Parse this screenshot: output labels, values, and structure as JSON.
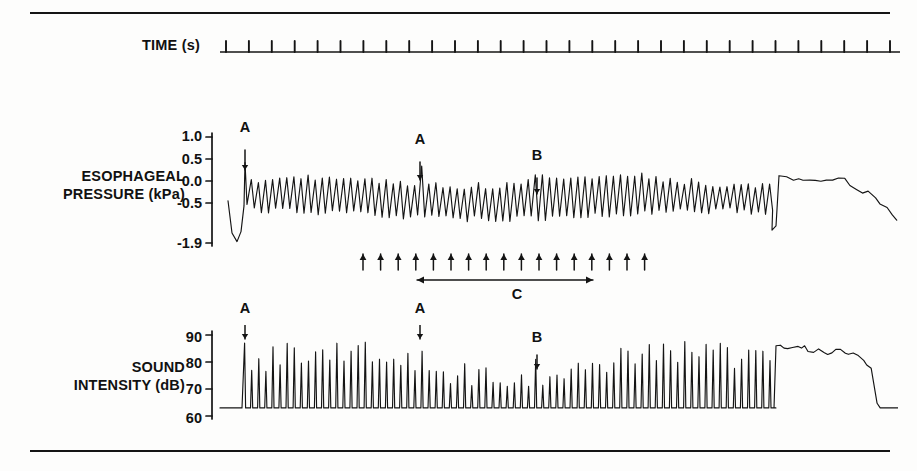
{
  "figure": {
    "title_rules": {
      "top_rule": "horizontal-rule",
      "bottom_rule": "horizontal-rule"
    }
  },
  "rows": {
    "time": {
      "label": "TIME (s)"
    },
    "pressure": {
      "label": "ESOPHAGEAL\nPRESSURE (kPa)"
    },
    "sound": {
      "label": "SOUND\nINTENSITY (dB)"
    }
  },
  "axes": {
    "pressure_ticks": [
      "1.0",
      "0.5",
      "0.0",
      "-0.5",
      "-1.9"
    ],
    "sound_ticks": [
      "90",
      "80",
      "70",
      "60"
    ]
  },
  "markers": {
    "pressure": [
      {
        "label": "A",
        "x": 245
      },
      {
        "label": "A",
        "x": 420
      },
      {
        "label": "B",
        "x": 537
      }
    ],
    "sound": [
      {
        "label": "A",
        "x": 245
      },
      {
        "label": "A",
        "x": 420
      },
      {
        "label": "B",
        "x": 537
      }
    ],
    "bracket": {
      "label": "C"
    }
  },
  "chart_data": {
    "type": "line",
    "title": "",
    "panels": [
      {
        "name": "time",
        "ylabel": "TIME (s)",
        "type": "tick-axis",
        "description": "baseline with regular upward tick marks, one per second",
        "tick_count": 30,
        "x_start": 228,
        "x_end": 886
      },
      {
        "name": "esophageal-pressure",
        "ylabel": "ESOPHAGEAL PRESSURE (kPa)",
        "yticks": [
          1.0,
          0.5,
          0.0,
          -0.5,
          -1.9
        ],
        "ylim": [
          -1.9,
          1.0
        ],
        "xlabel": "",
        "grid": false,
        "description": "rapid oscillating pressure trace with a large initial spike (A), a mid spike (A), a smaller spike (B), then a sustained high plateau that decays",
        "annotations": [
          {
            "label": "A",
            "x_frac": 0.025,
            "note": "initial large pressure spike"
          },
          {
            "label": "A",
            "x_frac": 0.29,
            "note": "second pressure spike"
          },
          {
            "label": "B",
            "x_frac": 0.47,
            "note": "smaller pressure spike"
          },
          {
            "label": "C",
            "note": "double-headed span beneath arrow row"
          }
        ],
        "arrow_row_count": 17
      },
      {
        "name": "sound-intensity",
        "ylabel": "SOUND INTENSITY (dB)",
        "yticks": [
          90,
          80,
          70,
          60
        ],
        "ylim": [
          58,
          95
        ],
        "xlabel": "",
        "grid": false,
        "description": "baseline near 63 dB with repeated sharp bursts to 78-88 dB, followed by a sustained plateau near 85 dB that falls back to baseline",
        "baseline_db": 63,
        "burst_peak_db_range": [
          74,
          88
        ],
        "plateau_db": 85,
        "annotations": [
          {
            "label": "A",
            "x_frac": 0.025
          },
          {
            "label": "A",
            "x_frac": 0.29
          },
          {
            "label": "B",
            "x_frac": 0.47
          }
        ]
      }
    ]
  }
}
